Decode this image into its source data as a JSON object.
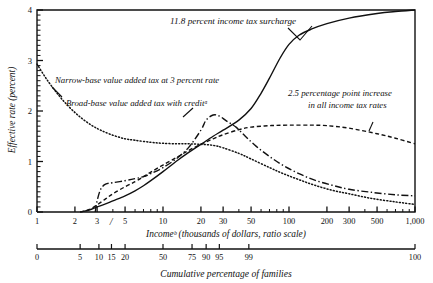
{
  "figure": {
    "ylabel": "Effective rate (percent)",
    "xlabel_primary": "Incomeᵇ (thousands of dollars, ratio scale)",
    "xlabel_secondary": "Cumulative percentage of families",
    "axis_break_marker": "/"
  },
  "annotations": {
    "surcharge": "11.8 percent income tax surcharge",
    "narrow_base": "Narrow-base value added tax at 3 percent rate",
    "broad_base": "Broad-base value added tax with creditᵃ",
    "rate_increase_line1": "2.5 percentage point increase",
    "rate_increase_line2": "in all income tax rates"
  },
  "chart_data": {
    "type": "line",
    "title": "",
    "xlabel": "Incomeᵇ (thousands of dollars, ratio scale)",
    "ylabel": "Effective rate (percent)",
    "xscale": "log",
    "xlim": [
      1,
      1000
    ],
    "ylim": [
      0,
      4
    ],
    "grid": false,
    "legend": "annotations-inline",
    "xticks": [
      1,
      2,
      3,
      5,
      10,
      20,
      30,
      50,
      100,
      200,
      300,
      500,
      1000
    ],
    "xticklabels": [
      "1",
      "2",
      "3",
      "5",
      "10",
      "20",
      "30",
      "50",
      "100",
      "200",
      "300",
      "500",
      "1,000"
    ],
    "yticks": [
      0,
      1,
      2,
      3,
      4
    ],
    "yticklabels": [
      "0",
      "1",
      "2",
      "3",
      "4"
    ],
    "y_minor_tick_step": 0.1,
    "secondary_axis": {
      "label": "Cumulative percentage of families",
      "ticks": [
        0,
        5,
        10,
        15,
        20,
        50,
        75,
        90,
        95,
        99,
        100
      ],
      "ticklabels": [
        "0",
        "5",
        "10",
        "15",
        "20",
        "50",
        "75",
        "90",
        "95",
        "99",
        "100"
      ],
      "tick_income_values": [
        1,
        2.2,
        3.1,
        3.9,
        5.0,
        10.0,
        17.0,
        22.0,
        28.0,
        48.0,
        1000
      ]
    },
    "series": [
      {
        "name": "11.8 percent income tax surcharge",
        "style": "solid",
        "points": [
          [
            2.2,
            0.0
          ],
          [
            2.6,
            0.04
          ],
          [
            3.0,
            0.1
          ],
          [
            3.5,
            0.16
          ],
          [
            4.0,
            0.22
          ],
          [
            5.0,
            0.32
          ],
          [
            6.0,
            0.42
          ],
          [
            7.0,
            0.52
          ],
          [
            8.0,
            0.62
          ],
          [
            10.0,
            0.8
          ],
          [
            13.0,
            1.02
          ],
          [
            16.0,
            1.18
          ],
          [
            20.0,
            1.34
          ],
          [
            25.0,
            1.5
          ],
          [
            30.0,
            1.62
          ],
          [
            40.0,
            1.82
          ],
          [
            50.0,
            2.05
          ],
          [
            60.0,
            2.35
          ],
          [
            70.0,
            2.65
          ],
          [
            85.0,
            3.05
          ],
          [
            100.0,
            3.32
          ],
          [
            120.0,
            3.5
          ],
          [
            150.0,
            3.62
          ],
          [
            200.0,
            3.73
          ],
          [
            300.0,
            3.84
          ],
          [
            500.0,
            3.93
          ],
          [
            700.0,
            3.97
          ],
          [
            1000.0,
            4.0
          ]
        ]
      },
      {
        "name": "2.5 percentage point increase in all income tax rates",
        "style": "dashed",
        "points": [
          [
            2.2,
            0.0
          ],
          [
            2.6,
            0.05
          ],
          [
            3.0,
            0.14
          ],
          [
            3.5,
            0.26
          ],
          [
            4.0,
            0.36
          ],
          [
            5.0,
            0.5
          ],
          [
            6.0,
            0.6
          ],
          [
            7.0,
            0.7
          ],
          [
            8.0,
            0.79
          ],
          [
            10.0,
            0.93
          ],
          [
            13.0,
            1.09
          ],
          [
            16.0,
            1.22
          ],
          [
            20.0,
            1.34
          ],
          [
            25.0,
            1.45
          ],
          [
            30.0,
            1.53
          ],
          [
            40.0,
            1.63
          ],
          [
            50.0,
            1.68
          ],
          [
            70.0,
            1.71
          ],
          [
            100.0,
            1.72
          ],
          [
            150.0,
            1.72
          ],
          [
            200.0,
            1.71
          ],
          [
            300.0,
            1.66
          ],
          [
            500.0,
            1.55
          ],
          [
            700.0,
            1.46
          ],
          [
            1000.0,
            1.35
          ]
        ]
      },
      {
        "name": "Broad-base value added tax with credit",
        "style": "dashdot",
        "points": [
          [
            2.9,
            0.0
          ],
          [
            3.0,
            0.22
          ],
          [
            3.2,
            0.45
          ],
          [
            3.5,
            0.55
          ],
          [
            4.0,
            0.58
          ],
          [
            5.0,
            0.62
          ],
          [
            6.0,
            0.66
          ],
          [
            7.0,
            0.7
          ],
          [
            8.0,
            0.76
          ],
          [
            10.0,
            0.88
          ],
          [
            13.0,
            1.07
          ],
          [
            16.0,
            1.28
          ],
          [
            20.0,
            1.62
          ],
          [
            22.0,
            1.82
          ],
          [
            25.0,
            1.92
          ],
          [
            28.0,
            1.9
          ],
          [
            32.0,
            1.8
          ],
          [
            38.0,
            1.68
          ],
          [
            45.0,
            1.5
          ],
          [
            55.0,
            1.3
          ],
          [
            70.0,
            1.1
          ],
          [
            90.0,
            0.92
          ],
          [
            120.0,
            0.76
          ],
          [
            160.0,
            0.63
          ],
          [
            220.0,
            0.53
          ],
          [
            300.0,
            0.45
          ],
          [
            450.0,
            0.39
          ],
          [
            700.0,
            0.34
          ],
          [
            1000.0,
            0.32
          ]
        ]
      },
      {
        "name": "Narrow-base value added tax at 3 percent rate",
        "style": "dotted",
        "points": [
          [
            1.0,
            2.93
          ],
          [
            1.2,
            2.62
          ],
          [
            1.5,
            2.3
          ],
          [
            1.8,
            2.08
          ],
          [
            2.2,
            1.88
          ],
          [
            2.7,
            1.72
          ],
          [
            3.2,
            1.62
          ],
          [
            4.0,
            1.52
          ],
          [
            5.0,
            1.45
          ],
          [
            6.0,
            1.42
          ],
          [
            8.0,
            1.38
          ],
          [
            10.0,
            1.36
          ],
          [
            13.0,
            1.35
          ],
          [
            16.0,
            1.35
          ],
          [
            20.0,
            1.34
          ],
          [
            25.0,
            1.32
          ],
          [
            30.0,
            1.27
          ],
          [
            40.0,
            1.16
          ],
          [
            50.0,
            1.05
          ],
          [
            70.0,
            0.88
          ],
          [
            90.0,
            0.76
          ],
          [
            120.0,
            0.64
          ],
          [
            160.0,
            0.53
          ],
          [
            220.0,
            0.43
          ],
          [
            300.0,
            0.36
          ],
          [
            450.0,
            0.27
          ],
          [
            700.0,
            0.2
          ],
          [
            1000.0,
            0.15
          ]
        ]
      }
    ]
  }
}
